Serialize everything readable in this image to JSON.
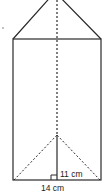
{
  "diagram": {
    "labels": {
      "height": "11 cm",
      "base": "14 cm"
    },
    "colors": {
      "stroke": "#2a2a2a",
      "background": "#ffffff"
    }
  }
}
